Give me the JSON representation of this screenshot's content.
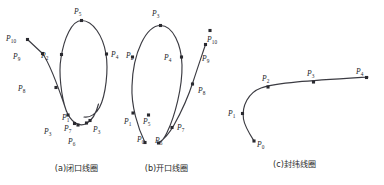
{
  "figure": {
    "background": "#ffffff",
    "stroke_color": "#3b3b42",
    "node_color": "#2a2a30",
    "label_color": "#24242a"
  },
  "panels": [
    {
      "id": "a",
      "caption": "(a)闭口线圈",
      "curve_path": "M 27.5 39.5 L 42.5 53.5 C 50 64 58 86 66 110 C 70.5 122 79 127.5 86.5 123.5 C 92.5 120 96.5 112 98.5 104 M 66.5 111.5 C 61 96 58.5 72 61 58 C 64 38 72 20.5 81.5 20.5 C 93 20.5 103 36 106 54 C 108.5 69.5 106 95 99.5 107.5 C 96.5 113.5 90 118 84 117",
      "labels": [
        {
          "text": "P",
          "sub": "5",
          "x": 74,
          "y": 8
        },
        {
          "text": "P",
          "sub": "10",
          "x": 6,
          "y": 35
        },
        {
          "text": "P",
          "sub": "9",
          "x": 13,
          "y": 53
        },
        {
          "text": "P",
          "sub": "2",
          "x": 41,
          "y": 52
        },
        {
          "text": "P",
          "sub": "4",
          "x": 111,
          "y": 51
        },
        {
          "text": "P",
          "sub": "8",
          "x": 18,
          "y": 85
        },
        {
          "text": "P",
          "sub": "1",
          "x": 62,
          "y": 114
        },
        {
          "text": "P",
          "sub": "7",
          "x": 64,
          "y": 125
        },
        {
          "text": "P",
          "sub": "3",
          "x": 44,
          "y": 128
        },
        {
          "text": "P",
          "sub": "6",
          "x": 68,
          "y": 138
        },
        {
          "text": "P",
          "sub": "3",
          "x": 93,
          "y": 126
        }
      ],
      "nodes": [
        {
          "x": 27.5,
          "y": 39.5
        },
        {
          "x": 42.5,
          "y": 53.5
        },
        {
          "x": 56,
          "y": 87.5
        },
        {
          "x": 68,
          "y": 115
        },
        {
          "x": 74.5,
          "y": 123.5
        },
        {
          "x": 81.5,
          "y": 20.5
        },
        {
          "x": 61.5,
          "y": 54.5
        },
        {
          "x": 106.5,
          "y": 54
        },
        {
          "x": 78,
          "y": 125
        },
        {
          "x": 86.5,
          "y": 123
        },
        {
          "x": 90,
          "y": 120.5
        }
      ]
    },
    {
      "id": "b",
      "caption": "(b)开口线圈",
      "curve_path": "M 145 142.5 C 138 128 131 106 132 86 C 133 52 146.5 25.5 160.5 25.5 C 173 25.5 181.5 45 182 65 C 182.5 87 175 116 167 132.5 C 164.5 138 161 142 158.5 143 M 158.5 143 C 163 140 169.5 133 174 125 C 181 112.5 188 97.5 193 82 C 197.5 68 202 55 205.5 44.5",
      "labels": [
        {
          "text": "P",
          "sub": "3",
          "x": 152,
          "y": 10
        },
        {
          "text": "P",
          "sub": "2",
          "x": 126,
          "y": 52
        },
        {
          "text": "P",
          "sub": "4",
          "x": 164,
          "y": 54
        },
        {
          "text": "P",
          "sub": "10",
          "x": 207,
          "y": 36
        },
        {
          "text": "P",
          "sub": "9",
          "x": 202,
          "y": 55
        },
        {
          "text": "P",
          "sub": "8",
          "x": 198,
          "y": 87
        },
        {
          "text": "P",
          "sub": "1",
          "x": 124,
          "y": 118
        },
        {
          "text": "P",
          "sub": "5",
          "x": 143,
          "y": 118
        },
        {
          "text": "P",
          "sub": "0",
          "x": 137,
          "y": 136
        },
        {
          "text": "P",
          "sub": "6",
          "x": 155,
          "y": 137
        },
        {
          "text": "P",
          "sub": "7",
          "x": 177,
          "y": 124
        }
      ],
      "nodes": [
        {
          "x": 160.5,
          "y": 25.5
        },
        {
          "x": 132.5,
          "y": 57
        },
        {
          "x": 181.5,
          "y": 57
        },
        {
          "x": 133,
          "y": 113
        },
        {
          "x": 148.5,
          "y": 115
        },
        {
          "x": 145,
          "y": 142.5
        },
        {
          "x": 158.5,
          "y": 143
        },
        {
          "x": 172,
          "y": 127.5
        },
        {
          "x": 192.5,
          "y": 84
        },
        {
          "x": 205.5,
          "y": 44.5
        },
        {
          "x": 210,
          "y": 30.5
        }
      ]
    },
    {
      "id": "c",
      "caption": "(c)封纬线圈",
      "curve_path": "M 254 141 C 249 133 244.5 126 243.5 119 C 241.5 106 248.5 92.5 261 88 C 277 82.5 312 80.5 368 77",
      "labels": [
        {
          "text": "P",
          "sub": "1",
          "x": 228,
          "y": 110
        },
        {
          "text": "P",
          "sub": "2",
          "x": 262,
          "y": 75
        },
        {
          "text": "P",
          "sub": "3",
          "x": 307,
          "y": 70
        },
        {
          "text": "P",
          "sub": "4",
          "x": 356,
          "y": 68
        },
        {
          "text": "P",
          "sub": "0",
          "x": 257,
          "y": 141
        }
      ],
      "nodes": [
        {
          "x": 242.5,
          "y": 113.5
        },
        {
          "x": 268,
          "y": 87
        },
        {
          "x": 313.5,
          "y": 82
        },
        {
          "x": 366.5,
          "y": 77.5
        },
        {
          "x": 254,
          "y": 141
        }
      ]
    }
  ],
  "captions": [
    {
      "text": "(a)闭口线圈",
      "x": 34,
      "y": 164,
      "width": 85
    },
    {
      "text": "(b)开口线圈",
      "x": 124,
      "y": 164,
      "width": 85
    },
    {
      "text": "(c)封纬线圈",
      "x": 252,
      "y": 160,
      "width": 85
    }
  ]
}
